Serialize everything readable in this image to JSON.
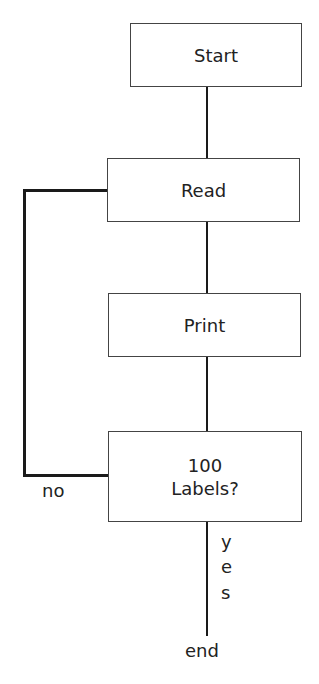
{
  "diagram": {
    "type": "flowchart",
    "nodes": [
      {
        "id": "start",
        "label": "Start"
      },
      {
        "id": "read",
        "label": "Read"
      },
      {
        "id": "print",
        "label": "Print"
      },
      {
        "id": "decision",
        "label_line1": "100",
        "label_line2": "Labels?"
      }
    ],
    "edges": {
      "no_label": "no",
      "yes_letters": [
        "y",
        "e",
        "s"
      ],
      "end_label": "end"
    },
    "colors": {
      "line": "#1a1a1a",
      "border": "#444444"
    }
  }
}
